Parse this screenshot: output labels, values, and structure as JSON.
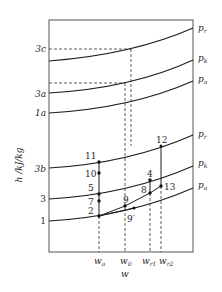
{
  "diagram": {
    "type": "h-w diagram (enthalpy vs. humidity ratio)",
    "axis": {
      "y_label": "h /kJ/kg",
      "x_label": "w",
      "x_ticks": [
        {
          "id": "wa",
          "main": "w",
          "sub": "a"
        },
        {
          "id": "w0",
          "main": "w",
          "sub": "0"
        },
        {
          "id": "wr1",
          "main": "w",
          "sub": "r1"
        },
        {
          "id": "wr2",
          "main": "w",
          "sub": "r2"
        }
      ],
      "y_ticks": [
        "3c",
        "3a",
        "1a",
        "3b",
        "3",
        "1"
      ]
    },
    "curves_upper": [
      {
        "id": "pr_upper",
        "label_main": "p",
        "label_sub": "r"
      },
      {
        "id": "pk_upper",
        "label_main": "p",
        "label_sub": "k"
      },
      {
        "id": "pa_upper",
        "label_main": "p",
        "label_sub": "a"
      }
    ],
    "curves_lower": [
      {
        "id": "pr_lower",
        "label_main": "p",
        "label_sub": "r"
      },
      {
        "id": "pk_lower",
        "label_main": "p",
        "label_sub": "k"
      },
      {
        "id": "pa_lower",
        "label_main": "p",
        "label_sub": "a"
      }
    ],
    "points": [
      {
        "id": "p11",
        "label": "11"
      },
      {
        "id": "p10",
        "label": "10"
      },
      {
        "id": "p5",
        "label": "5"
      },
      {
        "id": "p7",
        "label": "7"
      },
      {
        "id": "p2",
        "label": "2"
      },
      {
        "id": "p9",
        "label": "9"
      },
      {
        "id": "p9prime",
        "label": "9′"
      },
      {
        "id": "p8",
        "label": "8"
      },
      {
        "id": "p4",
        "label": "4"
      },
      {
        "id": "p13",
        "label": "13"
      },
      {
        "id": "p12",
        "label": "12"
      }
    ],
    "colors": {
      "line": "#1e1e1e",
      "frame": "#555555",
      "background": "#ffffff"
    }
  }
}
